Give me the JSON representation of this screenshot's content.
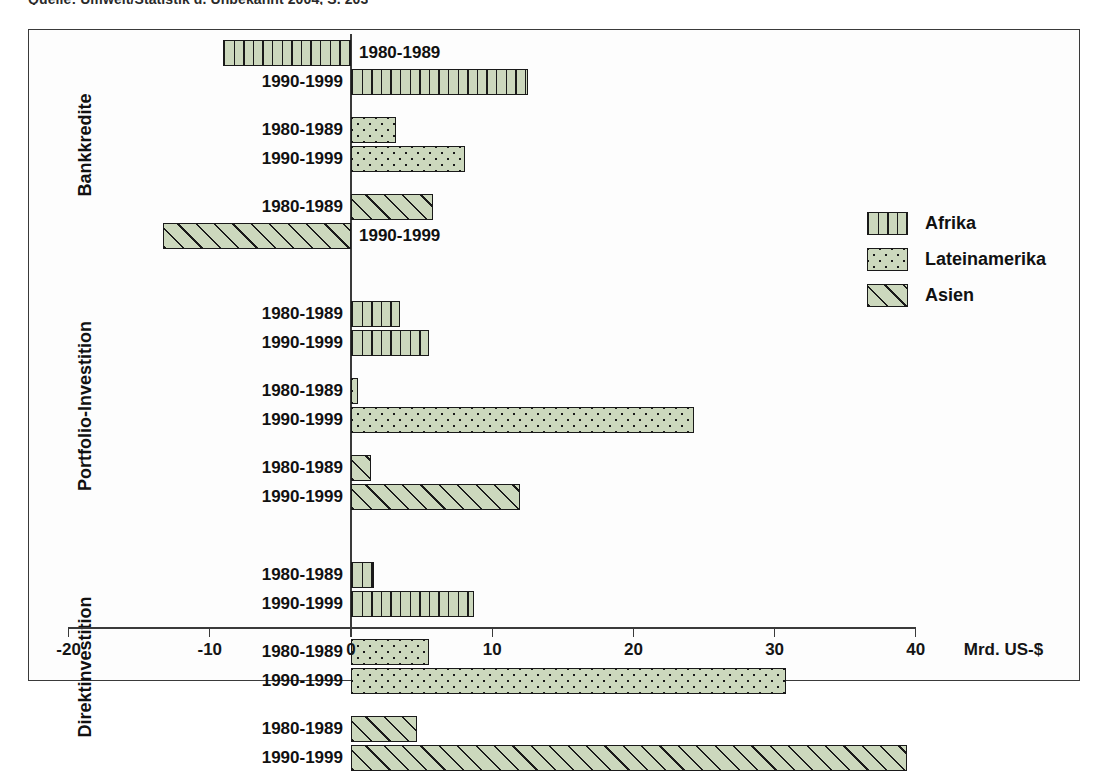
{
  "caption": "Quelle: Umwelt/Statistik d. Unbekannt 2004, S. 203",
  "chart_data": {
    "type": "bar",
    "orientation": "horizontal",
    "title": "",
    "xlabel": "Mrd. US-$",
    "ylabel": "",
    "xlim": [
      -20,
      40
    ],
    "xticks": [
      -20,
      -10,
      0,
      10,
      20,
      30,
      40
    ],
    "xticklabels": [
      "-20",
      "-10",
      "0",
      "10",
      "20",
      "30",
      "40"
    ],
    "grid": false,
    "legend_position": "right",
    "legend": [
      "Afrika",
      "Lateinamerika",
      "Asien"
    ],
    "series_patterns": {
      "Afrika": "vertical-lines",
      "Lateinamerika": "dots",
      "Asien": "diagonal-hatch"
    },
    "colors": {
      "fill": "#ccd8bd",
      "outline": "#1a1a1a",
      "frame": "#3a3a3a",
      "text": "#111111"
    },
    "periods": [
      "1980-1989",
      "1990-1999"
    ],
    "groups": [
      {
        "name": "Bankkredite",
        "series": [
          {
            "name": "Afrika",
            "values": [
              -9.1,
              12.5
            ]
          },
          {
            "name": "Lateinamerika",
            "values": [
              3.2,
              8.1
            ]
          },
          {
            "name": "Asien",
            "values": [
              5.8,
              -13.3
            ]
          }
        ]
      },
      {
        "name": "Portfolio-Investition",
        "series": [
          {
            "name": "Afrika",
            "values": [
              3.5,
              5.5
            ]
          },
          {
            "name": "Lateinamerika",
            "values": [
              0.5,
              24.3
            ]
          },
          {
            "name": "Asien",
            "values": [
              1.4,
              12.0
            ]
          }
        ]
      },
      {
        "name": "Direktinvestition",
        "series": [
          {
            "name": "Afrika",
            "values": [
              1.6,
              8.7
            ]
          },
          {
            "name": "Lateinamerika",
            "values": [
              5.5,
              30.8
            ]
          },
          {
            "name": "Asien",
            "values": [
              4.7,
              39.4
            ]
          }
        ]
      }
    ]
  }
}
